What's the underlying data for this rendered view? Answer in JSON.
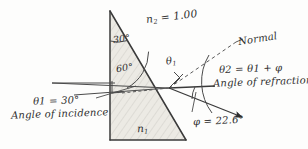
{
  "figure": {
    "kind": "optics-refraction-prism-diagram",
    "background_color": "#fdfdfc",
    "ink_color": "#2e2e2e",
    "prism_fill": "#e9e9e4"
  },
  "labels": {
    "n2": {
      "symbol": "n",
      "subscript": "2",
      "equals": "=",
      "value": "1.00",
      "text": "n2 = 1.00"
    },
    "n1": {
      "symbol": "n",
      "subscript": "1",
      "text": "n1"
    },
    "apex_angle": "30°",
    "interface_angle": "60°",
    "theta1_at_surface": {
      "symbol": "θ",
      "subscript": "1",
      "text": "θ1"
    },
    "normal": "Normal",
    "theta2_equation": {
      "text": "θ2 = θ1 + φ",
      "lhs": "θ2",
      "equals": "=",
      "rhs": "θ1 + φ"
    },
    "angle_of_refraction": "Angle of refraction",
    "theta1_value": {
      "text": "θ1 = 30°",
      "symbol": "θ1",
      "equals": "=",
      "value": "30°"
    },
    "angle_of_incidence": "Angle of incidence",
    "phi_value": {
      "text": "φ = 22.6°",
      "symbol": "φ",
      "equals": "=",
      "value": "22.6°"
    }
  },
  "geometry": {
    "prism_apex": [
      110,
      11
    ],
    "prism_bottom_left": [
      110,
      140
    ],
    "prism_bottom_right": [
      186,
      140
    ],
    "incidence_point": [
      169,
      88
    ],
    "normal_dashed_end": [
      236,
      42
    ],
    "refracted_ray_end": [
      244,
      118
    ],
    "incident_ray_start": [
      52,
      83
    ]
  },
  "values": {
    "n2_index": 1.0,
    "apex_degrees": 30,
    "interface_degrees": 60,
    "theta1_degrees": 30,
    "phi_degrees": 22.6
  }
}
